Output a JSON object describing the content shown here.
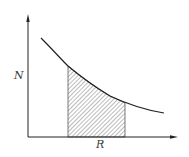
{
  "diagram": {
    "type": "decreasing-curve-with-hatched-area",
    "y_axis_label": "N",
    "x_axis_label": "R",
    "colors": {
      "background": "#ffffff",
      "stroke": "#2a2a2a",
      "hatch": "#555555"
    },
    "curve_points": [
      [
        41,
        38
      ],
      [
        55,
        52
      ],
      [
        68,
        66
      ],
      [
        85,
        80
      ],
      [
        100,
        90
      ],
      [
        115,
        98
      ],
      [
        125,
        103
      ],
      [
        140,
        108
      ],
      [
        152,
        111
      ],
      [
        164,
        113
      ]
    ],
    "shaded_region": {
      "x_start": 68,
      "x_end": 125,
      "baseline_y": 137
    }
  }
}
